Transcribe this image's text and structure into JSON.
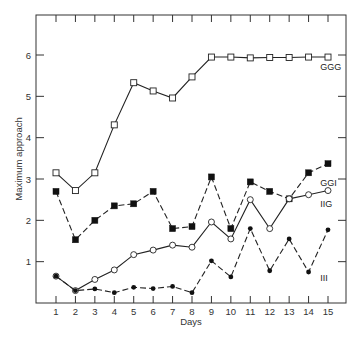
{
  "chart_data": {
    "type": "line",
    "title": "",
    "xlabel": "Days",
    "ylabel": "Maximum approach",
    "x": [
      1,
      2,
      3,
      4,
      5,
      6,
      7,
      8,
      9,
      10,
      11,
      12,
      13,
      14,
      15
    ],
    "xticks": [
      "1",
      "2",
      "3",
      "4",
      "5",
      "6",
      "7",
      "8",
      "9",
      "10",
      "11",
      "12",
      "13",
      "14",
      "15"
    ],
    "yticks": [
      "1",
      "2",
      "3",
      "4",
      "5",
      "6"
    ],
    "xlim": [
      0,
      16
    ],
    "ylim": [
      0,
      7
    ],
    "grid": false,
    "legend": "inline labels at line ends",
    "series": [
      {
        "name": "GGG",
        "marker": "open-square",
        "line": "solid",
        "values": [
          3.15,
          2.72,
          3.15,
          4.31,
          5.33,
          5.13,
          4.96,
          5.47,
          5.95,
          5.95,
          5.93,
          5.94,
          5.94,
          5.95,
          5.95
        ]
      },
      {
        "name": "GGI",
        "marker": "filled-square",
        "line": "dashed",
        "values": [
          2.7,
          1.53,
          2.0,
          2.35,
          2.4,
          2.7,
          1.8,
          1.85,
          3.05,
          1.8,
          2.93,
          2.7,
          2.52,
          3.15,
          3.37
        ]
      },
      {
        "name": "IIG",
        "marker": "open-circle",
        "line": "solid",
        "values": [
          0.65,
          0.3,
          0.57,
          0.8,
          1.17,
          1.28,
          1.4,
          1.35,
          1.96,
          1.55,
          2.5,
          1.8,
          2.52,
          2.62,
          2.72
        ]
      },
      {
        "name": "III",
        "marker": "filled-circle",
        "line": "dashed",
        "values": [
          0.65,
          0.3,
          0.34,
          0.25,
          0.38,
          0.35,
          0.4,
          0.25,
          1.02,
          0.63,
          1.8,
          0.78,
          1.55,
          0.75,
          1.77
        ]
      }
    ],
    "annotations": [
      {
        "text": "GGG",
        "x": 14.6,
        "y": 5.7
      },
      {
        "text": "GGI",
        "x": 14.6,
        "y": 2.9
      },
      {
        "text": "IIG",
        "x": 14.6,
        "y": 2.4
      },
      {
        "text": "III",
        "x": 14.6,
        "y": 0.6
      }
    ]
  }
}
